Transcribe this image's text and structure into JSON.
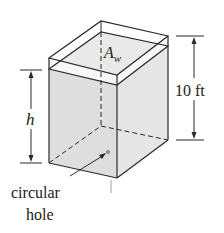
{
  "figure": {
    "type": "tank-diagram",
    "labels": {
      "area": "A",
      "area_subscript": "w",
      "height_var": "h",
      "tank_height": "10 ft",
      "hole_line1": "circular",
      "hole_line2": "hole"
    },
    "colors": {
      "stroke": "#2a2a2a",
      "water_fill": "#dcdcdc",
      "water_side_fill": "#e2e2e2",
      "background": "#ffffff"
    }
  }
}
